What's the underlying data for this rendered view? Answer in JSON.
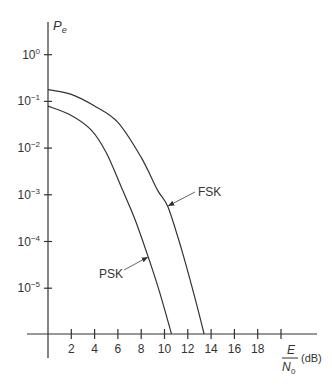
{
  "chart_data": {
    "type": "line",
    "title": "",
    "ylabel": "P_e",
    "xlabel": "E/N0 (dB)",
    "xlabel_parts": {
      "numerator": "E",
      "denominator": "N",
      "denominator_sub": "0",
      "unit": "(dB)"
    },
    "yscale": "log",
    "ylim": [
      1e-06,
      1
    ],
    "xlim": [
      0,
      20
    ],
    "x_ticks": [
      2,
      4,
      6,
      8,
      10,
      12,
      14,
      16,
      18,
      20
    ],
    "x_tick_labels": [
      "2",
      "4",
      "6",
      "8",
      "10",
      "12",
      "14",
      "16",
      "18",
      ""
    ],
    "y_ticks": [
      0,
      -1,
      -2,
      -3,
      -4,
      -5
    ],
    "y_tick_labels": [
      {
        "base": "10",
        "exp": "0"
      },
      {
        "base": "10",
        "exp": "−1"
      },
      {
        "base": "10",
        "exp": "−2"
      },
      {
        "base": "10",
        "exp": "−3"
      },
      {
        "base": "10",
        "exp": "−4"
      },
      {
        "base": "10",
        "exp": "−5"
      }
    ],
    "grid": false,
    "legend": "inline annotations with arrows",
    "series": [
      {
        "name": "FSK",
        "x": [
          0,
          2,
          4,
          6,
          8,
          9.4,
          10.3,
          11.5,
          12.5,
          13.4
        ],
        "log10_y": [
          -0.75,
          -0.85,
          -1.1,
          -1.45,
          -2.2,
          -2.9,
          -3.26,
          -4.2,
          -5.1,
          -6.0
        ],
        "values": [
          0.18,
          0.14,
          0.079,
          0.035,
          0.0063,
          0.0013,
          0.00055,
          6.3e-05,
          7.9e-06,
          1e-06
        ]
      },
      {
        "name": "PSK",
        "x": [
          0,
          2,
          3.7,
          5,
          6.4,
          7.5,
          8.6,
          9.6,
          10.6
        ],
        "log10_y": [
          -1.1,
          -1.3,
          -1.61,
          -2.1,
          -2.9,
          -3.55,
          -4.33,
          -5.1,
          -6.0
        ],
        "values": [
          0.079,
          0.05,
          0.025,
          0.0079,
          0.0013,
          0.00028,
          4.7e-05,
          7.9e-06,
          1e-06
        ]
      }
    ],
    "annotations": [
      {
        "text": "FSK",
        "arrow_to_x_dB": 10.3
      },
      {
        "text": "PSK",
        "arrow_to_x_dB": 8.6
      }
    ]
  }
}
